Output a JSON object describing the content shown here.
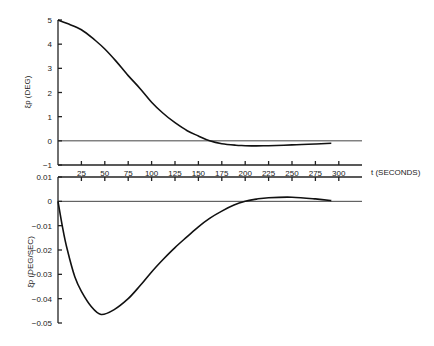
{
  "chart_data": [
    {
      "type": "line",
      "title": "",
      "ylabel": "ξp (DEG)",
      "xlabel": "t (SECONDS)",
      "xlim": [
        0,
        325
      ],
      "ylim": [
        -1,
        5
      ],
      "yticks": [
        5,
        4,
        3,
        2,
        1,
        0,
        -1
      ],
      "ytick_labels": [
        "5",
        "4",
        "3",
        "2",
        "1",
        "0",
        "−1"
      ],
      "xticks": [
        25,
        50,
        75,
        100,
        125,
        150,
        175,
        200,
        225,
        250,
        275,
        300
      ],
      "xtick_labels": [
        "25",
        "50",
        "75",
        "100",
        "125",
        "150",
        "175",
        "200",
        "225",
        "250",
        "275",
        "300"
      ],
      "zero_line": true,
      "grid": false,
      "series": [
        {
          "name": "xi_p",
          "x": [
            0,
            10,
            25,
            40,
            50,
            62,
            75,
            88,
            100,
            112,
            125,
            138,
            150,
            162,
            175,
            190,
            200,
            212,
            225,
            250,
            275,
            292
          ],
          "y": [
            5.0,
            4.85,
            4.6,
            4.15,
            3.8,
            3.3,
            2.7,
            2.15,
            1.6,
            1.15,
            0.75,
            0.42,
            0.2,
            0.0,
            -0.12,
            -0.18,
            -0.2,
            -0.21,
            -0.2,
            -0.17,
            -0.13,
            -0.1
          ]
        }
      ]
    },
    {
      "type": "line",
      "title": "",
      "ylabel": "ξ̇p (DEG/SEC)",
      "xlabel": "",
      "xlim": [
        0,
        325
      ],
      "ylim": [
        -0.05,
        0.01
      ],
      "yticks": [
        0.01,
        0,
        -0.01,
        -0.02,
        -0.03,
        -0.04,
        -0.05
      ],
      "ytick_labels": [
        "0.01",
        "0",
        "−0.01",
        "−0.02",
        "−0.03",
        "−0.04",
        "−0.05"
      ],
      "xticks": [
        25,
        50,
        75,
        100,
        125,
        150,
        175,
        200,
        225,
        250,
        275,
        300
      ],
      "zero_line": true,
      "grid": false,
      "series": [
        {
          "name": "xi_p_dot",
          "x": [
            0,
            5,
            10,
            18,
            25,
            35,
            46,
            60,
            75,
            88,
            100,
            112,
            125,
            138,
            150,
            162,
            175,
            188,
            200,
            212,
            225,
            250,
            275,
            292
          ],
          "y": [
            0,
            -0.011,
            -0.02,
            -0.031,
            -0.037,
            -0.043,
            -0.0465,
            -0.0445,
            -0.04,
            -0.0345,
            -0.029,
            -0.024,
            -0.019,
            -0.0145,
            -0.0105,
            -0.007,
            -0.004,
            -0.0015,
            0.0,
            0.0009,
            0.0015,
            0.0017,
            0.001,
            0.0003
          ]
        }
      ]
    }
  ]
}
